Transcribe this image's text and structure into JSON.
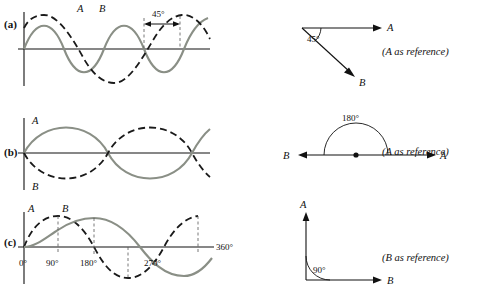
{
  "figure": {
    "rows": [
      {
        "key": "a",
        "row_label": "(a)",
        "wave": {
          "curve_solid_label": "A",
          "curve_dashed_label": "B",
          "phase_annotation": "45°",
          "axis_ticks": []
        },
        "phasor": {
          "angle_label": "45°",
          "vector_labels": [
            "A",
            "B"
          ]
        },
        "reference_note": "(A as reference)"
      },
      {
        "key": "b",
        "row_label": "(b)",
        "wave": {
          "curve_solid_label": "A",
          "curve_dashed_label": "B",
          "phase_annotation": "",
          "axis_ticks": []
        },
        "phasor": {
          "angle_label": "180°",
          "vector_labels": [
            "A",
            "B"
          ]
        },
        "reference_note": "(A as reference)"
      },
      {
        "key": "c",
        "row_label": "(c)",
        "wave": {
          "curve_solid_label": "A",
          "curve_dashed_label": "B",
          "phase_annotation": "",
          "axis_ticks": [
            "0°",
            "90°",
            "180°",
            "270°",
            "360°"
          ]
        },
        "phasor": {
          "angle_label": "90°",
          "vector_labels": [
            "A",
            "B"
          ]
        },
        "reference_note": "(B as reference)"
      }
    ],
    "colors": {
      "solid_curve": "#8a8f86",
      "dashed_curve": "#1a1a1a",
      "axis": "#111111",
      "guide": "#555555",
      "background": "#ffffff"
    }
  }
}
